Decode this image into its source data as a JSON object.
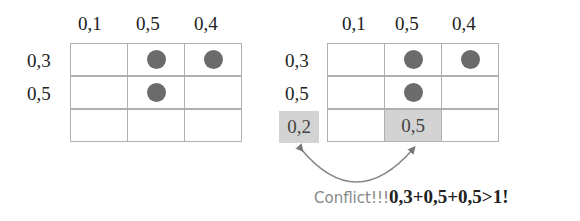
{
  "left_grid": {
    "col_labels": [
      "0,1",
      "0,5",
      "0,4"
    ],
    "row_labels": [
      "0,3",
      "0,5"
    ],
    "dots": [
      [
        false,
        true,
        true
      ],
      [
        false,
        true,
        false
      ],
      [
        false,
        false,
        false
      ]
    ]
  },
  "right_grid": {
    "col_labels": [
      "0,1",
      "0,5",
      "0,4"
    ],
    "row_labels": [
      "0,3",
      "0,5",
      "0,2"
    ],
    "dots": [
      [
        false,
        true,
        true
      ],
      [
        false,
        true,
        false
      ],
      [
        false,
        false,
        false
      ]
    ],
    "highlighted_cell_value": "0,5",
    "highlighted_row_label": "0,2"
  },
  "caption": {
    "prefix": "Conflict!!!",
    "formula": "0,3+0,5+0,5>1!"
  },
  "colors": {
    "dot": "#6b6b6b",
    "highlight": "#d3d3d3",
    "grid_line": "#b0b0b0",
    "arrow": "#777777"
  }
}
